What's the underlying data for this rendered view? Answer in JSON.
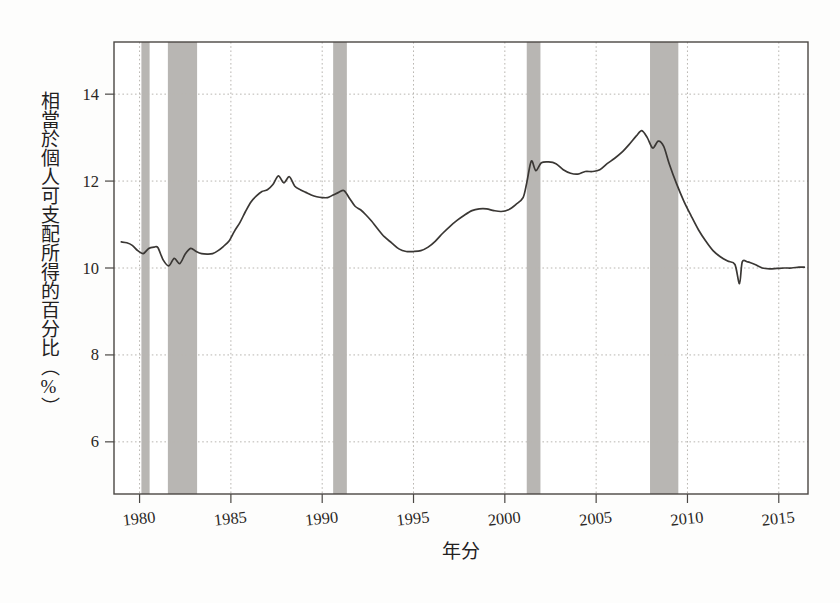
{
  "figure": {
    "background_color": "#fdfdfc",
    "plot_background_color": "#ffffff",
    "frame_color": "#4a4744",
    "line_color": "#3a3734",
    "grid_color": "#b9b6b1",
    "recession_band_color": "#b8b6b3"
  },
  "chart_data": {
    "type": "line",
    "title": "",
    "subtitle": "",
    "xlabel": "年分",
    "ylabel": "相當於個人可支配所得的百分比（%）",
    "xlim": [
      1978.6,
      2016.6
    ],
    "ylim": [
      4.8,
      15.2
    ],
    "xticks": [
      1980,
      1985,
      1990,
      1995,
      2000,
      2005,
      2010,
      2015
    ],
    "xticklabels": [
      "1980",
      "1985",
      "1990",
      "1995",
      "2000",
      "2005",
      "2010",
      "2015"
    ],
    "yticks": [
      6,
      8,
      10,
      12,
      14
    ],
    "yticklabels": [
      "6",
      "8",
      "10",
      "12",
      "14"
    ],
    "grid": true,
    "grid_style": "dotted",
    "legend": null,
    "legend_position": "none",
    "series": [
      {
        "name": "相當於個人可支配所得的百分比",
        "color": "#3a3734",
        "x": [
          1979.0,
          1979.3,
          1979.6,
          1979.9,
          1980.2,
          1980.5,
          1980.8,
          1981.0,
          1981.3,
          1981.6,
          1981.9,
          1982.2,
          1982.5,
          1982.8,
          1983.1,
          1983.4,
          1983.7,
          1984.0,
          1984.3,
          1984.6,
          1984.9,
          1985.2,
          1985.5,
          1985.8,
          1986.1,
          1986.4,
          1986.7,
          1987.0,
          1987.3,
          1987.6,
          1987.9,
          1988.2,
          1988.5,
          1988.8,
          1989.1,
          1989.4,
          1989.7,
          1990.0,
          1990.3,
          1990.6,
          1990.9,
          1991.2,
          1991.5,
          1991.8,
          1992.1,
          1992.4,
          1992.7,
          1993.0,
          1993.4,
          1993.8,
          1994.2,
          1994.6,
          1995.0,
          1995.4,
          1995.8,
          1996.2,
          1996.6,
          1997.0,
          1997.4,
          1997.8,
          1998.2,
          1998.6,
          1999.0,
          1999.4,
          1999.8,
          2000.2,
          2000.6,
          2001.0,
          2001.2,
          2001.45,
          2001.7,
          2002.0,
          2002.4,
          2002.8,
          2003.2,
          2003.6,
          2004.0,
          2004.4,
          2004.8,
          2005.2,
          2005.6,
          2006.0,
          2006.4,
          2006.8,
          2007.2,
          2007.5,
          2007.8,
          2008.1,
          2008.4,
          2008.7,
          2009.0,
          2009.4,
          2009.8,
          2010.2,
          2010.6,
          2011.0,
          2011.4,
          2011.8,
          2012.2,
          2012.6,
          2012.85,
          2013.0,
          2013.3,
          2013.7,
          2014.1,
          2014.5,
          2014.9,
          2015.3,
          2015.7,
          2016.1,
          2016.4
        ],
        "y": [
          10.6,
          10.58,
          10.52,
          10.4,
          10.33,
          10.45,
          10.48,
          10.47,
          10.18,
          10.05,
          10.22,
          10.1,
          10.32,
          10.45,
          10.38,
          10.33,
          10.32,
          10.33,
          10.4,
          10.5,
          10.62,
          10.85,
          11.05,
          11.3,
          11.52,
          11.66,
          11.76,
          11.8,
          11.92,
          12.12,
          11.96,
          12.1,
          11.88,
          11.8,
          11.74,
          11.68,
          11.64,
          11.62,
          11.62,
          11.68,
          11.74,
          11.78,
          11.6,
          11.42,
          11.34,
          11.22,
          11.08,
          10.92,
          10.72,
          10.58,
          10.44,
          10.38,
          10.38,
          10.4,
          10.48,
          10.62,
          10.8,
          10.96,
          11.1,
          11.22,
          11.32,
          11.36,
          11.36,
          11.32,
          11.3,
          11.34,
          11.46,
          11.62,
          11.96,
          12.46,
          12.24,
          12.42,
          12.44,
          12.4,
          12.26,
          12.18,
          12.16,
          12.22,
          12.22,
          12.26,
          12.4,
          12.52,
          12.66,
          12.84,
          13.04,
          13.16,
          13.0,
          12.76,
          12.92,
          12.8,
          12.4,
          11.94,
          11.54,
          11.2,
          10.88,
          10.62,
          10.4,
          10.26,
          10.16,
          10.08,
          9.64,
          10.14,
          10.14,
          10.08,
          10.0,
          9.98,
          9.99,
          10.0,
          10.0,
          10.02,
          10.02
        ]
      }
    ],
    "shaded_regions": [
      {
        "name": "recession-1980",
        "x0": 1980.1,
        "x1": 1980.55,
        "color": "#b8b6b3"
      },
      {
        "name": "recession-1981-1982",
        "x0": 1981.55,
        "x1": 1983.15,
        "color": "#b8b6b3"
      },
      {
        "name": "recession-1990-1991",
        "x0": 1990.6,
        "x1": 1991.35,
        "color": "#b8b6b3"
      },
      {
        "name": "recession-2001",
        "x0": 2001.2,
        "x1": 2001.95,
        "color": "#b8b6b3"
      },
      {
        "name": "recession-2008-2009",
        "x0": 2007.95,
        "x1": 2009.5,
        "color": "#b8b6b3"
      }
    ]
  }
}
